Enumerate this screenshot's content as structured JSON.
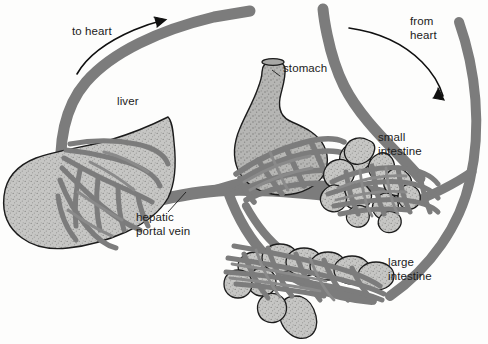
{
  "diagram": {
    "background_color": "#fdfdfc",
    "colors": {
      "vessel": "#7c7c7c",
      "vessel_dark": "#6e6e6e",
      "organ_fill": "#bdbdbd",
      "organ_fill_light": "#cdcdcb",
      "organ_outline": "#1c1c1c",
      "text": "#1b1b1b",
      "arrow": "#101010"
    },
    "labels": [
      {
        "id": "to-heart",
        "text": "to heart",
        "x": 72,
        "y": 31,
        "align": "left",
        "description": "blood flow direction leaving the liver toward the heart"
      },
      {
        "id": "from-heart",
        "text": "from\nheart",
        "x": 410,
        "y": 20,
        "align": "left",
        "description": "arterial blood flow direction arriving from the heart"
      },
      {
        "id": "liver",
        "text": "liver",
        "x": 117,
        "y": 100,
        "align": "left",
        "description": "organ label for the liver"
      },
      {
        "id": "stomach",
        "text": "stomach",
        "x": 283,
        "y": 66,
        "align": "left",
        "description": "organ label for the stomach"
      },
      {
        "id": "small-intestine",
        "text": "small\nintestine",
        "x": 378,
        "y": 135,
        "align": "left",
        "description": "organ label for the small intestine"
      },
      {
        "id": "large-intestine",
        "text": "large\nintestine",
        "x": 388,
        "y": 260,
        "align": "left",
        "description": "organ label for the large intestine"
      },
      {
        "id": "hepatic-portal-vein",
        "text": "hepatic\nportal vein",
        "x": 136,
        "y": 215,
        "align": "left",
        "description": "vessel label for the hepatic portal vein, with leader line pointing up-right to the vein junction"
      }
    ],
    "organs": [
      {
        "id": "liver",
        "name": "liver"
      },
      {
        "id": "stomach",
        "name": "stomach"
      },
      {
        "id": "small-intestine",
        "name": "small intestine"
      },
      {
        "id": "large-intestine",
        "name": "large intestine"
      }
    ],
    "vessels": [
      {
        "id": "hepatic-vein-to-heart",
        "name": "hepatic vein to heart"
      },
      {
        "id": "artery-from-heart",
        "name": "artery from heart"
      },
      {
        "id": "hepatic-portal-vein",
        "name": "hepatic portal vein"
      },
      {
        "id": "gastric-capillary-bed",
        "name": "stomach capillary bed"
      },
      {
        "id": "small-intestine-capillary-bed",
        "name": "small intestine capillary bed"
      },
      {
        "id": "large-intestine-capillary-bed",
        "name": "large intestine capillary bed"
      },
      {
        "id": "liver-capillary-bed",
        "name": "liver capillary bed"
      }
    ],
    "flow_arrows": [
      {
        "id": "to-heart-arrow",
        "direction": "up-right",
        "label_ref": "to-heart"
      },
      {
        "id": "from-heart-arrow",
        "direction": "down-right",
        "label_ref": "from-heart"
      }
    ]
  }
}
